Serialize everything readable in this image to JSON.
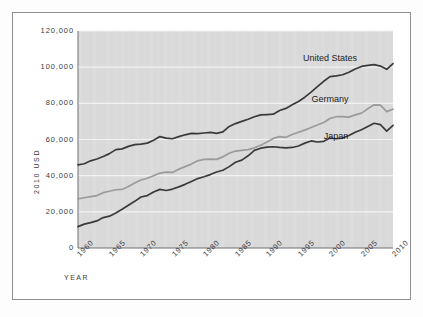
{
  "chart_data": {
    "type": "line",
    "title": "",
    "xlabel": "YEAR",
    "ylabel": "2010 USD",
    "xlim": [
      1960,
      2010
    ],
    "ylim": [
      0,
      120000
    ],
    "grid": true,
    "legend_position": "inline-right",
    "xticks": [
      "1960",
      "1965",
      "1970",
      "1975",
      "1980",
      "1985",
      "1990",
      "1995",
      "2000",
      "2005",
      "2010"
    ],
    "yticks": [
      "0",
      "20,000",
      "40,000",
      "60,000",
      "80,000",
      "100,000",
      "120,000"
    ],
    "x": [
      1960,
      1961,
      1962,
      1963,
      1964,
      1965,
      1966,
      1967,
      1968,
      1969,
      1970,
      1971,
      1972,
      1973,
      1974,
      1975,
      1976,
      1977,
      1978,
      1979,
      1980,
      1981,
      1982,
      1983,
      1984,
      1985,
      1986,
      1987,
      1988,
      1989,
      1990,
      1991,
      1992,
      1993,
      1994,
      1995,
      1996,
      1997,
      1998,
      1999,
      2000,
      2001,
      2002,
      2003,
      2004,
      2005,
      2006,
      2007,
      2008,
      2009,
      2010
    ],
    "series": [
      {
        "name": "United States",
        "color": "#3a3a3c",
        "values": [
          46000,
          46600,
          48200,
          49200,
          50600,
          52200,
          54400,
          54800,
          56200,
          57200,
          57400,
          58000,
          59600,
          61600,
          60800,
          60400,
          61600,
          62600,
          63400,
          63200,
          63600,
          63900,
          63400,
          64200,
          67200,
          68800,
          70000,
          71200,
          72600,
          73600,
          73800,
          74000,
          76000,
          77200,
          79200,
          81000,
          83400,
          86200,
          89200,
          92200,
          94800,
          95200,
          95800,
          97200,
          99000,
          100400,
          101000,
          101400,
          100600,
          98800,
          102000
        ]
      },
      {
        "name": "Germany",
        "color": "#9b9b9e",
        "values": [
          27200,
          27800,
          28400,
          29000,
          30600,
          31400,
          32200,
          32400,
          34000,
          36000,
          37600,
          38600,
          40000,
          41400,
          42000,
          41800,
          43600,
          45000,
          46400,
          48200,
          49000,
          49200,
          49000,
          50400,
          52400,
          53600,
          54000,
          54400,
          55400,
          56800,
          58600,
          60600,
          61600,
          61200,
          62800,
          64000,
          65200,
          66600,
          68000,
          69400,
          71600,
          72600,
          72600,
          72400,
          73600,
          74600,
          77000,
          79200,
          79000,
          75400,
          76800
        ]
      },
      {
        "name": "Japan",
        "color": "#3a3a3c",
        "values": [
          11800,
          13200,
          14000,
          15000,
          16800,
          17600,
          19400,
          21400,
          23600,
          25800,
          28200,
          29000,
          31000,
          32400,
          31800,
          32600,
          33800,
          35200,
          36800,
          38400,
          39400,
          40600,
          42000,
          43000,
          45000,
          47400,
          48600,
          51000,
          54000,
          55200,
          55800,
          56000,
          55600,
          55400,
          55600,
          56400,
          58000,
          59200,
          58600,
          59000,
          60800,
          60400,
          60800,
          62200,
          64000,
          65400,
          67200,
          69000,
          68200,
          64600,
          67800
        ]
      }
    ],
    "annotations": [
      {
        "text": "United States",
        "x": 2000,
        "y": 104500
      },
      {
        "text": "Germany",
        "x": 2000,
        "y": 82000
      },
      {
        "text": "Japan",
        "x": 2001,
        "y": 61500
      }
    ]
  },
  "style": {
    "plot_background": "#d9d9d9",
    "gridline_color": "#f2f2f2",
    "frame_color": "#8c8e93",
    "page_background": "#fdfdfd",
    "text_color": "#3c3c3e"
  }
}
